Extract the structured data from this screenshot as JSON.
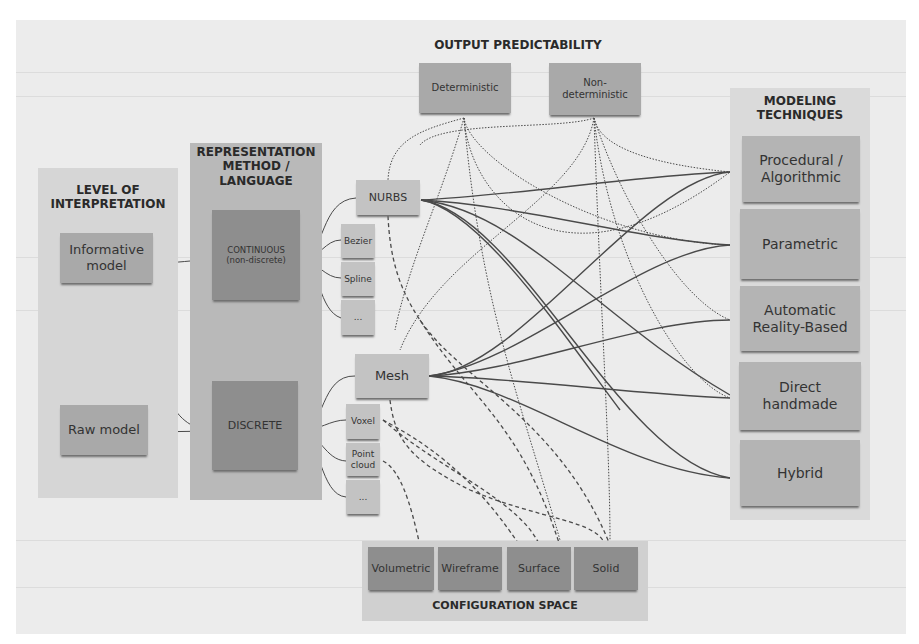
{
  "diagram": {
    "output_predictability": {
      "title": "OUTPUT PREDICTABILITY",
      "items": [
        {
          "label": "Deterministic"
        },
        {
          "label": "Non-\ndeterministic"
        }
      ]
    },
    "modeling_techniques": {
      "title": "MODELING\nTECHNIQUES",
      "items": [
        {
          "label": "Procedural /\nAlgorithmic"
        },
        {
          "label": "Parametric"
        },
        {
          "label": "Automatic\nReality-Based"
        },
        {
          "label": "Direct\nhandmade"
        },
        {
          "label": "Hybrid"
        }
      ]
    },
    "level_of_interpretation": {
      "title": "LEVEL OF\nINTERPRETATION",
      "items": [
        {
          "label": "Informative\nmodel"
        },
        {
          "label": "Raw model"
        }
      ]
    },
    "representation_method": {
      "title": "REPRESENTATION\nMETHOD /\nLANGUAGE",
      "items": [
        {
          "label": "CONTINUOUS\n(non-discrete)"
        },
        {
          "label": "DISCRETE"
        }
      ]
    },
    "continuous_types": {
      "main": "NURBS",
      "sub": [
        {
          "label": "Bezier"
        },
        {
          "label": "Spline"
        },
        {
          "label": "..."
        }
      ]
    },
    "discrete_types": {
      "main": "Mesh",
      "sub": [
        {
          "label": "Voxel"
        },
        {
          "label": "Point\ncloud"
        },
        {
          "label": "..."
        }
      ]
    },
    "configuration_space": {
      "title": "CONFIGURATION SPACE",
      "items": [
        {
          "label": "Volumetric"
        },
        {
          "label": "Wireframe"
        },
        {
          "label": "Surface"
        },
        {
          "label": "Solid"
        }
      ]
    },
    "colors": {
      "page_background": "#ececec",
      "level_panel": "#d6d6d6",
      "representation_panel": "#b9b9b9",
      "dark_box": "#8e8e8e",
      "medium_box": "#a9a9a9",
      "light_box": "#c3c3c3",
      "technique_box": "#b4b4b4",
      "link_line": "#4a4a4a"
    }
  }
}
